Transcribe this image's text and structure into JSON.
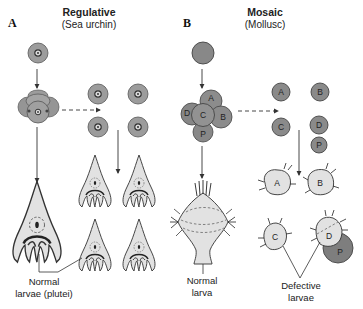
{
  "panels": [
    {
      "id": "A",
      "letter": "A",
      "title": "Regulative",
      "subtitle": "(Sea urchin)",
      "caption_line1": "Normal",
      "caption_line2": "larvae (plutei)"
    },
    {
      "id": "B",
      "letter": "B",
      "title": "Mosaic",
      "subtitle": "(Mollusc)",
      "normal_caption_line1": "Normal",
      "normal_caption_line2": "larva",
      "defective_caption_line1": "Defective",
      "defective_caption_line2": "larvae"
    }
  ],
  "blastomeres": {
    "embryo": [
      "A",
      "B",
      "C",
      "D",
      "P"
    ],
    "isolated": [
      "A",
      "B",
      "C",
      "D",
      "P"
    ],
    "defective_larvae": [
      "A",
      "B",
      "C",
      "D",
      "P"
    ]
  },
  "colors": {
    "cell_fill": "#9a9a9a",
    "cell_dark": "#7a7a7a",
    "larva_fill": "#e0e0e0",
    "outline": "#333333",
    "nucleus_fill": "#d8d8d8"
  }
}
